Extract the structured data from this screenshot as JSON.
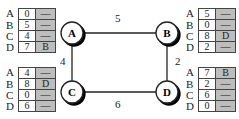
{
  "graph": {
    "nodes": [
      {
        "id": "A",
        "x": 72,
        "y": 33
      },
      {
        "id": "B",
        "x": 167,
        "y": 33
      },
      {
        "id": "C",
        "x": 72,
        "y": 92
      },
      {
        "id": "D",
        "x": 167,
        "y": 92
      }
    ],
    "edges": [
      {
        "from": "A",
        "to": "B",
        "weight": "5"
      },
      {
        "from": "A",
        "to": "C",
        "weight": "4"
      },
      {
        "from": "B",
        "to": "D",
        "weight": "2"
      },
      {
        "from": "C",
        "to": "D",
        "weight": "6"
      }
    ]
  },
  "tables": {
    "A": {
      "rows": [
        {
          "dest": "A",
          "dist": "0",
          "next": "—"
        },
        {
          "dest": "B",
          "dist": "5",
          "next": "—"
        },
        {
          "dest": "C",
          "dist": "4",
          "next": "—"
        },
        {
          "dest": "D",
          "dist": "7",
          "next": "B"
        }
      ]
    },
    "B": {
      "rows": [
        {
          "dest": "A",
          "dist": "5",
          "next": "—"
        },
        {
          "dest": "B",
          "dist": "0",
          "next": "—"
        },
        {
          "dest": "C",
          "dist": "8",
          "next": "D"
        },
        {
          "dest": "D",
          "dist": "2",
          "next": "—"
        }
      ]
    },
    "C": {
      "rows": [
        {
          "dest": "A",
          "dist": "4",
          "next": "—"
        },
        {
          "dest": "B",
          "dist": "8",
          "next": "D"
        },
        {
          "dest": "C",
          "dist": "0",
          "next": "—"
        },
        {
          "dest": "D",
          "dist": "6",
          "next": "—"
        }
      ]
    },
    "D": {
      "rows": [
        {
          "dest": "A",
          "dist": "7",
          "next": "B"
        },
        {
          "dest": "B",
          "dist": "2",
          "next": "—"
        },
        {
          "dest": "C",
          "dist": "6",
          "next": "—"
        },
        {
          "dest": "D",
          "dist": "0",
          "next": "—"
        }
      ]
    }
  },
  "colors": {
    "hop_fill": "#bdbdbd",
    "line": "#222222"
  }
}
